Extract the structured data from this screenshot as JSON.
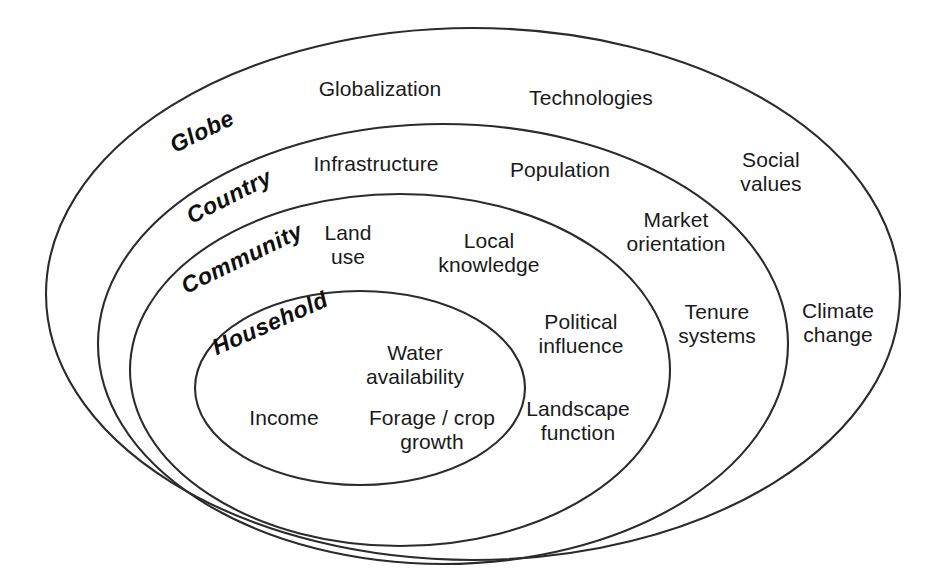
{
  "figure": {
    "type": "nested-ellipse-diagram",
    "background_color": "#ffffff",
    "stroke_color": "#2b2b2b",
    "text_color": "#1a1a1a"
  },
  "scales": [
    {
      "id": "globe",
      "label": "Globe"
    },
    {
      "id": "country",
      "label": "Country"
    },
    {
      "id": "community",
      "label": "Community"
    },
    {
      "id": "household",
      "label": "Household"
    }
  ],
  "factors": {
    "globe": [
      {
        "id": "globalization",
        "label": "Globalization"
      },
      {
        "id": "technologies",
        "label": "Technologies"
      },
      {
        "id": "climate-change",
        "label": "Climate\nchange"
      }
    ],
    "country": [
      {
        "id": "infrastructure",
        "label": "Infrastructure"
      },
      {
        "id": "population",
        "label": "Population"
      },
      {
        "id": "social-values",
        "label": "Social\nvalues"
      },
      {
        "id": "tenure-systems",
        "label": "Tenure\nsystems"
      }
    ],
    "community": [
      {
        "id": "land-use",
        "label": "Land\nuse"
      },
      {
        "id": "local-knowledge",
        "label": "Local\nknowledge"
      },
      {
        "id": "market-orientation",
        "label": "Market\norientation"
      },
      {
        "id": "political-influence",
        "label": "Political\ninfluence"
      },
      {
        "id": "landscape-function",
        "label": "Landscape\nfunction"
      }
    ],
    "household": [
      {
        "id": "water-availability",
        "label": "Water\navailability"
      },
      {
        "id": "income",
        "label": "Income"
      },
      {
        "id": "forage-crop-growth",
        "label": "Forage / crop\ngrowth"
      }
    ]
  }
}
